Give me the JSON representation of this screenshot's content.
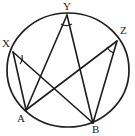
{
  "figure": {
    "type": "circle-geometry-diagram",
    "background_color": "#ffffff",
    "stroke_color": "#1d1d1d",
    "label_color": "#1a1a1a",
    "circle": {
      "name": "circumscribed-circle",
      "cx": 68,
      "cy": 70,
      "rx": 61,
      "ry": 57,
      "stroke_width": 1.7
    },
    "points": [
      {
        "id": "X",
        "label": "X",
        "x": 13,
        "y": 52,
        "label_x": 2,
        "label_y": 38,
        "on_circle": true
      },
      {
        "id": "Y",
        "label": "Y",
        "x": 67,
        "y": 15,
        "label_x": 63,
        "label_y": 1,
        "on_circle": true
      },
      {
        "id": "Z",
        "label": "Z",
        "x": 117,
        "y": 41,
        "label_x": 120,
        "label_y": 25,
        "on_circle": true
      },
      {
        "id": "A",
        "label": "A",
        "x": 26,
        "y": 110,
        "label_x": 17,
        "label_y": 113,
        "on_circle": true
      },
      {
        "id": "B",
        "label": "B",
        "x": 93,
        "y": 123,
        "label_x": 92,
        "label_y": 124,
        "on_circle": true
      }
    ],
    "chords": [
      {
        "name": "chord-XA",
        "from": "X",
        "to": "A"
      },
      {
        "name": "chord-XB",
        "from": "X",
        "to": "B"
      },
      {
        "name": "chord-YA",
        "from": "Y",
        "to": "A"
      },
      {
        "name": "chord-YB",
        "from": "Y",
        "to": "B"
      },
      {
        "name": "chord-ZA",
        "from": "Z",
        "to": "A"
      },
      {
        "name": "chord-ZB",
        "from": "Z",
        "to": "B"
      }
    ],
    "angle_marks": [
      {
        "name": "angle-mark-at-X",
        "vertex": "X",
        "path": "M 22 55 A 11 11 0 0 1 20 64"
      },
      {
        "name": "angle-mark-at-Y",
        "vertex": "Y",
        "path": "M 61 24 A 11 11 0 0 0 72 24"
      },
      {
        "name": "angle-mark-at-Z",
        "vertex": "Z",
        "path": "M 107 47 A 12 12 0 0 0 114 53"
      }
    ]
  }
}
